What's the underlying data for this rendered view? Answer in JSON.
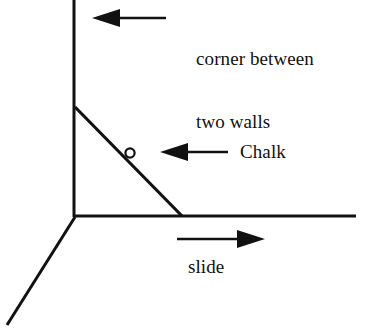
{
  "diagram": {
    "ink_color": "#111111",
    "background_color": "#ffffff",
    "labels": {
      "corner_line1": "corner between",
      "corner_line2": "two walls",
      "chalk": "Chalk",
      "slide": "slide"
    },
    "geometry": {
      "vertical_wall_edge": {
        "x1": 74,
        "y1": 0,
        "x2": 74,
        "y2": 217
      },
      "floor_edge": {
        "x1": 74,
        "y1": 216,
        "x2": 356,
        "y2": 216
      },
      "lower_left_edge": {
        "x1": 74,
        "y1": 217,
        "x2": 7,
        "y2": 325
      },
      "slope_line": {
        "x1": 75,
        "y1": 107,
        "x2": 182,
        "y2": 216
      },
      "chalk_circle": {
        "cx": 130,
        "cy": 153,
        "r": 4.5
      }
    },
    "arrows": {
      "corner_arrow": {
        "direction": "left",
        "x_tail": 166,
        "x_head": 92,
        "y": 18
      },
      "chalk_arrow": {
        "direction": "left",
        "x_tail": 228,
        "x_head": 160,
        "y": 152
      },
      "slide_arrow": {
        "direction": "right",
        "x_tail": 177,
        "x_head": 265,
        "y": 239
      }
    }
  }
}
